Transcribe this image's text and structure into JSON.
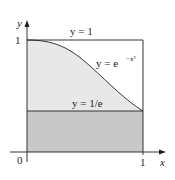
{
  "figure": {
    "axes": {
      "x_label": "x",
      "y_label": "y",
      "origin_label": "0",
      "x_tick_label": "1",
      "y_tick_label": "1"
    },
    "labels": {
      "top_line": "y = 1",
      "curve": "y = e",
      "curve_exponent": "−x²",
      "bottom_line": "y = 1/e"
    },
    "colors": {
      "dark_region": "#c8c8c8",
      "light_region": "#e6e6e6",
      "lines": "#231f20"
    }
  }
}
